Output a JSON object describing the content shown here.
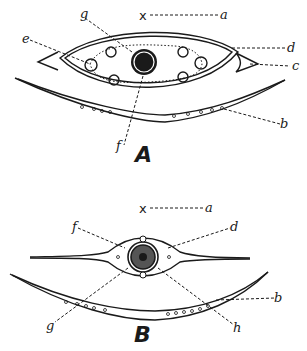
{
  "figure": {
    "panels": [
      {
        "id": "A",
        "title": "A",
        "axis_marker": "x",
        "labels": [
          "a",
          "b",
          "c",
          "d",
          "e",
          "f",
          "g"
        ]
      },
      {
        "id": "B",
        "title": "B",
        "axis_marker": "x",
        "labels": [
          "a",
          "b",
          "d",
          "f",
          "g",
          "h"
        ]
      }
    ]
  }
}
